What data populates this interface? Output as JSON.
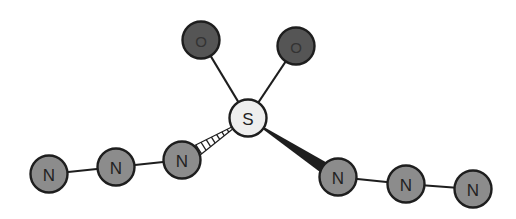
{
  "diagram": {
    "type": "molecule",
    "colors": {
      "nitrogen_fill": "#8c8c8c",
      "oxygen_fill": "#555555",
      "sulfur_fill": "#eeeeee",
      "stroke": "#1e1e1e",
      "bond": "#1e1e1e"
    },
    "atoms": [
      {
        "id": "O1",
        "label": "O",
        "element": "O",
        "x": 201,
        "y": 40
      },
      {
        "id": "O2",
        "label": "O",
        "element": "O",
        "x": 296,
        "y": 46
      },
      {
        "id": "S",
        "label": "S",
        "element": "S",
        "x": 248,
        "y": 118
      },
      {
        "id": "N1",
        "label": "N",
        "element": "N",
        "x": 49,
        "y": 174
      },
      {
        "id": "N2",
        "label": "N",
        "element": "N",
        "x": 116,
        "y": 167
      },
      {
        "id": "N3",
        "label": "N",
        "element": "N",
        "x": 182,
        "y": 160
      },
      {
        "id": "N4",
        "label": "N",
        "element": "N",
        "x": 338,
        "y": 177
      },
      {
        "id": "N5",
        "label": "N",
        "element": "N",
        "x": 406,
        "y": 184
      },
      {
        "id": "N6",
        "label": "N",
        "element": "N",
        "x": 473,
        "y": 189
      }
    ],
    "bonds": [
      {
        "from": "S",
        "to": "O1",
        "style": "single"
      },
      {
        "from": "S",
        "to": "O2",
        "style": "single"
      },
      {
        "from": "S",
        "to": "N3",
        "style": "hashed-wedge"
      },
      {
        "from": "S",
        "to": "N4",
        "style": "solid-wedge"
      },
      {
        "from": "N1",
        "to": "N2",
        "style": "single"
      },
      {
        "from": "N2",
        "to": "N3",
        "style": "single"
      },
      {
        "from": "N4",
        "to": "N5",
        "style": "single"
      },
      {
        "from": "N5",
        "to": "N6",
        "style": "single"
      }
    ]
  }
}
